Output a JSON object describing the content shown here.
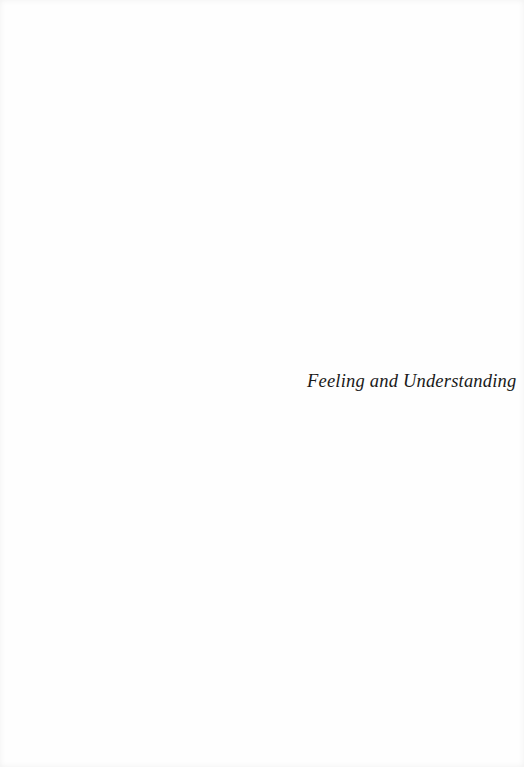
{
  "page": {
    "half_title": "Feeling and Understanding"
  }
}
